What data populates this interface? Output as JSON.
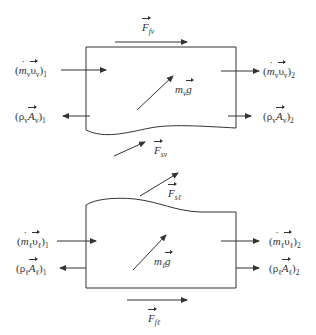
{
  "diagram": {
    "vapor": {
      "phase_sub": "v",
      "force_wall": {
        "symbol": "F",
        "sub": "fv"
      },
      "force_interface": {
        "symbol": "F",
        "sub": "sv"
      },
      "gravity": {
        "mass": "m",
        "mass_sub": "v",
        "g": "g"
      },
      "momentum_in": {
        "m": "m",
        "m_sub": "v",
        "v": "υ",
        "v_sub": "v",
        "index": "1"
      },
      "momentum_out": {
        "m": "m",
        "m_sub": "v",
        "v": "υ",
        "v_sub": "v",
        "index": "2"
      },
      "pressure_in": {
        "rho": "ρ",
        "rho_sub": "v",
        "A": "A",
        "A_sub": "v",
        "index": "1"
      },
      "pressure_out": {
        "rho": "ρ",
        "rho_sub": "v",
        "A": "A",
        "A_sub": "v",
        "index": "2"
      }
    },
    "liquid": {
      "phase_sub": "ℓ",
      "force_wall": {
        "symbol": "F",
        "sub": "fℓ"
      },
      "force_interface": {
        "symbol": "F",
        "sub": "sℓ"
      },
      "gravity": {
        "mass": "m",
        "mass_sub": "ℓ",
        "g": "g"
      },
      "momentum_in": {
        "m": "m",
        "m_sub": "ℓ",
        "v": "υ",
        "v_sub": "ℓ",
        "index": "1"
      },
      "momentum_out": {
        "m": "m",
        "m_sub": "ℓ",
        "v": "υ",
        "v_sub": "ℓ",
        "index": "2"
      },
      "pressure_in": {
        "rho": "ρ",
        "rho_sub": "ℓ",
        "A": "A",
        "A_sub": "ℓ",
        "index": "1"
      },
      "pressure_out": {
        "rho": "ρ",
        "rho_sub": "ℓ",
        "A": "A",
        "A_sub": "ℓ",
        "index": "2"
      }
    },
    "paren_open": "(",
    "paren_close": ")",
    "colors": {
      "line": "#333333",
      "background": "#ffffff"
    }
  }
}
